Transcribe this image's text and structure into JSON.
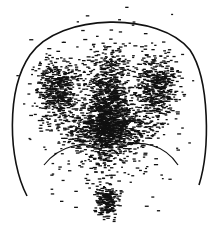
{
  "figure": {
    "width": 213,
    "height": 231,
    "background": "#ffffff",
    "ink": "#111111",
    "outline": {
      "description": "head outline: dome arc from left ~ (14,195) over top (~y=20) to right (~203,185)",
      "path": "M 27 196 C 8 160, 6 90, 30 55 C 60 12, 160 12, 190 50 C 210 80, 210 150, 199 185"
    },
    "inner_curves": [
      {
        "name": "left-lower-curve",
        "path": "M 44 165 C 60 145, 85 140, 100 150"
      },
      {
        "name": "right-lower-curve",
        "path": "M 118 148 C 140 138, 165 145, 178 165"
      }
    ],
    "density_blobs": [
      {
        "cx": 106,
        "cy": 110,
        "rx": 26,
        "ry": 80,
        "count": 900
      },
      {
        "cx": 55,
        "cy": 90,
        "rx": 30,
        "ry": 45,
        "count": 450
      },
      {
        "cx": 155,
        "cy": 88,
        "rx": 30,
        "ry": 45,
        "count": 450
      },
      {
        "cx": 106,
        "cy": 130,
        "rx": 60,
        "ry": 30,
        "count": 600
      },
      {
        "cx": 106,
        "cy": 200,
        "rx": 18,
        "ry": 22,
        "count": 220
      },
      {
        "cx": 106,
        "cy": 110,
        "rx": 100,
        "ry": 110,
        "count": 700
      }
    ],
    "dot": {
      "w": 3,
      "h": 1.3
    }
  }
}
